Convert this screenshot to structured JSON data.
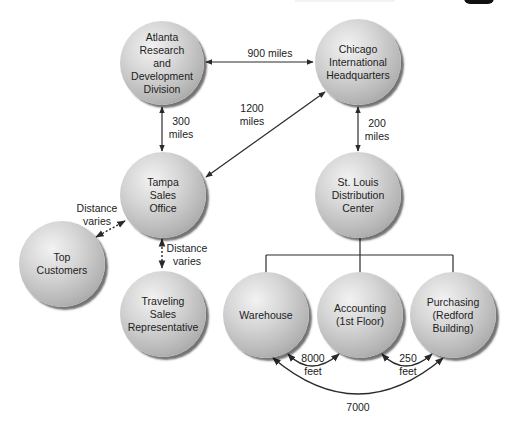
{
  "diagram": {
    "nodes": [
      {
        "id": "atlanta",
        "label": "Atlanta\nResearch\nand\nDevelopment\nDivision",
        "cx": 162,
        "cy": 63,
        "r": 42
      },
      {
        "id": "chicago",
        "label": "Chicago\nInternational\nHeadquarters",
        "cx": 358,
        "cy": 62,
        "r": 43
      },
      {
        "id": "tampa",
        "label": "Tampa\nSales\nOffice",
        "cx": 163,
        "cy": 195,
        "r": 43
      },
      {
        "id": "stlouis",
        "label": "St. Louis\nDistribution\nCenter",
        "cx": 358,
        "cy": 195,
        "r": 43
      },
      {
        "id": "customers",
        "label": "Top\nCustomers",
        "cx": 62,
        "cy": 264,
        "r": 43
      },
      {
        "id": "traveling",
        "label": "Traveling\nSales\nRepresentative",
        "cx": 163,
        "cy": 314,
        "r": 43
      },
      {
        "id": "warehouse",
        "label": "Warehouse",
        "cx": 266,
        "cy": 315,
        "r": 43
      },
      {
        "id": "accounting",
        "label": "Accounting\n(1st Floor)",
        "cx": 360,
        "cy": 315,
        "r": 43
      },
      {
        "id": "purchasing",
        "label": "Purchasing\n(Redford\nBuilding)",
        "cx": 453,
        "cy": 315,
        "r": 43
      }
    ],
    "edges": [
      {
        "from": "atlanta",
        "to": "chicago",
        "label": "900 miles",
        "style": "solid"
      },
      {
        "from": "atlanta",
        "to": "tampa",
        "label": "300\nmiles",
        "style": "solid"
      },
      {
        "from": "tampa",
        "to": "chicago",
        "label": "1200\nmiles",
        "style": "solid"
      },
      {
        "from": "chicago",
        "to": "stlouis",
        "label": "200\nmiles",
        "style": "solid"
      },
      {
        "from": "tampa",
        "to": "customers",
        "label": "Distance\nvaries",
        "style": "dashed"
      },
      {
        "from": "tampa",
        "to": "traveling",
        "label": "Distance\nvaries",
        "style": "dashed"
      },
      {
        "from": "warehouse",
        "to": "accounting",
        "label": "8000\nfeet",
        "style": "curved"
      },
      {
        "from": "accounting",
        "to": "purchasing",
        "label": "250\nfeet",
        "style": "curved"
      },
      {
        "from": "warehouse",
        "to": "purchasing",
        "label": "7000",
        "style": "curved"
      }
    ],
    "tree": {
      "parent": "stlouis",
      "children": [
        "warehouse",
        "accounting",
        "purchasing"
      ]
    },
    "edge_labels": {
      "atl_chi": "900 miles",
      "atl_tam": "300\nmiles",
      "tam_chi": "1200\nmiles",
      "chi_stl": "200\nmiles",
      "tam_cus": "Distance\nvaries",
      "tam_trv": "Distance\nvaries",
      "war_acc": "8000\nfeet",
      "acc_pur": "250\nfeet",
      "war_pur": "7000"
    },
    "colors": {
      "line": "#2a2a2a",
      "node_light": "#f2f2f2",
      "node_dark": "#8e8e8e"
    }
  }
}
